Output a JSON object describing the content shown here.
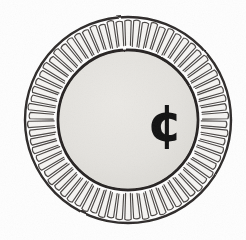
{
  "figure": {
    "kind": "diagram",
    "background_color": "#fefefe",
    "ink_color": "#2b2b2b",
    "canvas": {
      "width": 246,
      "height": 240
    }
  },
  "outer_rim": {
    "label": "outer rim circle",
    "center_x": 128,
    "center_y": 120,
    "radius": 103,
    "stroke_color": "#2e2b29",
    "stroke_width": 2.4,
    "fill_color": "#ffffff"
  },
  "reeding": {
    "label": "radial reed loops",
    "count": 70,
    "loop_outer_radius": 99,
    "loop_inner_radius": 74,
    "loop_half_width_deg": 1.85,
    "stroke_color": "#4a4644",
    "stroke_width": 1.15,
    "fill_color": "#f6f5f3"
  },
  "inner_disc": {
    "label": "inner disc",
    "center_x": 128,
    "center_y": 120,
    "radius": 70,
    "stroke_color": "#262321",
    "stroke_width": 2.8,
    "fill_color": "#e3e2de"
  },
  "center_symbol": {
    "label": "cent sign",
    "glyph": "¢",
    "name": "cent-symbol",
    "x": 165,
    "y": 127,
    "font_size": 52,
    "color": "#111111"
  },
  "annotations": {
    "caption": "",
    "legend": []
  }
}
